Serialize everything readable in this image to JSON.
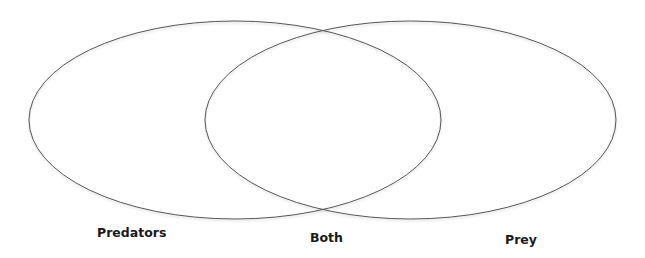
{
  "diagram": {
    "type": "venn",
    "stroke_color": "#555555",
    "sets": [
      {
        "id": "left",
        "label": "Predators",
        "cx": 235,
        "cy": 120,
        "rx": 206,
        "ry": 99
      },
      {
        "id": "right",
        "label": "Prey",
        "cx": 410.5,
        "cy": 120,
        "rx": 205.5,
        "ry": 99
      }
    ],
    "intersection_label": "Both"
  },
  "labels": {
    "left": "Predators",
    "center": "Both",
    "right": "Prey"
  }
}
